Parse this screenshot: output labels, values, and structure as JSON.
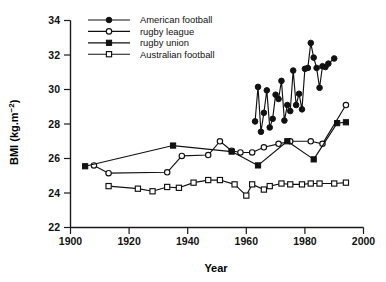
{
  "chart_data": {
    "type": "line",
    "title": "",
    "xlabel": "Year",
    "ylabel": "BMI (kg.m⁻²)",
    "xlim": [
      1900,
      2000
    ],
    "ylim": [
      22,
      34
    ],
    "xticks": [
      1900,
      1920,
      1940,
      1960,
      1980,
      2000
    ],
    "yticks": [
      22,
      24,
      26,
      28,
      30,
      32,
      34
    ],
    "xtick_labels": [
      "1900",
      "1920",
      "1940",
      "1960",
      "1980",
      "2000"
    ],
    "ytick_labels": [
      "22",
      "24",
      "26",
      "28",
      "30",
      "32",
      "34"
    ],
    "grid": false,
    "legend_position": "top-left",
    "series": [
      {
        "name": "American football",
        "marker": "filled-circle",
        "x": [
          1963,
          1964,
          1965,
          1966,
          1967,
          1968,
          1969,
          1970,
          1971,
          1972,
          1973,
          1974,
          1975,
          1976,
          1977,
          1978,
          1979,
          1980,
          1981,
          1982,
          1983,
          1984,
          1985,
          1986,
          1987,
          1988,
          1990
        ],
        "y": [
          28.15,
          30.15,
          27.55,
          28.65,
          29.95,
          27.8,
          28.3,
          29.7,
          29.45,
          30.5,
          28.2,
          29.1,
          28.75,
          31.1,
          29.1,
          29.75,
          28.85,
          31.2,
          31.25,
          32.7,
          31.85,
          31.25,
          30.1,
          31.35,
          31.3,
          31.5,
          31.8
        ]
      },
      {
        "name": "rugby league",
        "marker": "open-circle",
        "x": [
          1908,
          1913,
          1933,
          1938,
          1947,
          1951,
          1955,
          1958,
          1962,
          1966,
          1971,
          1975,
          1982,
          1986,
          1994
        ],
        "y": [
          25.6,
          25.15,
          25.2,
          26.15,
          26.2,
          27.0,
          26.45,
          26.35,
          26.35,
          26.65,
          26.85,
          27.0,
          27.0,
          26.85,
          29.1
        ]
      },
      {
        "name": "rugby union",
        "marker": "filled-square",
        "x": [
          1905,
          1935,
          1955,
          1964,
          1974,
          1983,
          1991,
          1994
        ],
        "y": [
          25.55,
          26.75,
          26.4,
          25.6,
          27.0,
          25.95,
          28.05,
          28.1
        ]
      },
      {
        "name": "Australian football",
        "marker": "open-square",
        "x": [
          1913,
          1923,
          1928,
          1933,
          1937,
          1942,
          1947,
          1951,
          1956,
          1960,
          1962,
          1966,
          1968,
          1972,
          1975,
          1979,
          1982,
          1985,
          1990,
          1994
        ],
        "y": [
          24.4,
          24.25,
          24.1,
          24.35,
          24.3,
          24.6,
          24.75,
          24.75,
          24.5,
          23.85,
          24.5,
          24.2,
          24.4,
          24.55,
          24.5,
          24.5,
          24.55,
          24.55,
          24.55,
          24.6
        ]
      }
    ]
  },
  "legend": {
    "entries": [
      {
        "label": "American football",
        "marker": "filled-circle"
      },
      {
        "label": "rugby league",
        "marker": "open-circle"
      },
      {
        "label": "rugby union",
        "marker": "filled-square"
      },
      {
        "label": "Australian football",
        "marker": "open-square"
      }
    ]
  },
  "axes": {
    "x_title": "Year",
    "y_title_main": "BMI (kg.m",
    "y_title_sup": "−2",
    "y_title_end": ")"
  }
}
